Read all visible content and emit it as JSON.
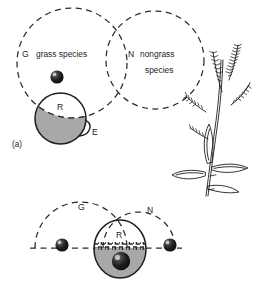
{
  "figure": {
    "panel_label": "(a)",
    "colors": {
      "stroke": "#1d1d1d",
      "dashed_stroke": "#2b2b2b",
      "region_fill": "#a8a8a8",
      "sphere_dark": "#171717",
      "sphere_highlight": "#b9b9b9",
      "background": "#ffffff"
    },
    "top_panel": {
      "set_g": {
        "symbol": "G",
        "name": "grass species"
      },
      "set_n": {
        "symbol": "N",
        "name_line1": "nongrass",
        "name_line2": "species"
      },
      "region_r": {
        "symbol": "R"
      },
      "region_e": {
        "symbol": "E"
      },
      "sphere_count": 1
    },
    "bottom_panel": {
      "set_g": {
        "symbol": "G"
      },
      "set_n": {
        "symbol": "N"
      },
      "region_r": {
        "symbol": "R"
      },
      "sphere_count": 3
    },
    "illustration": {
      "name": "grass-plant-drawing"
    }
  }
}
